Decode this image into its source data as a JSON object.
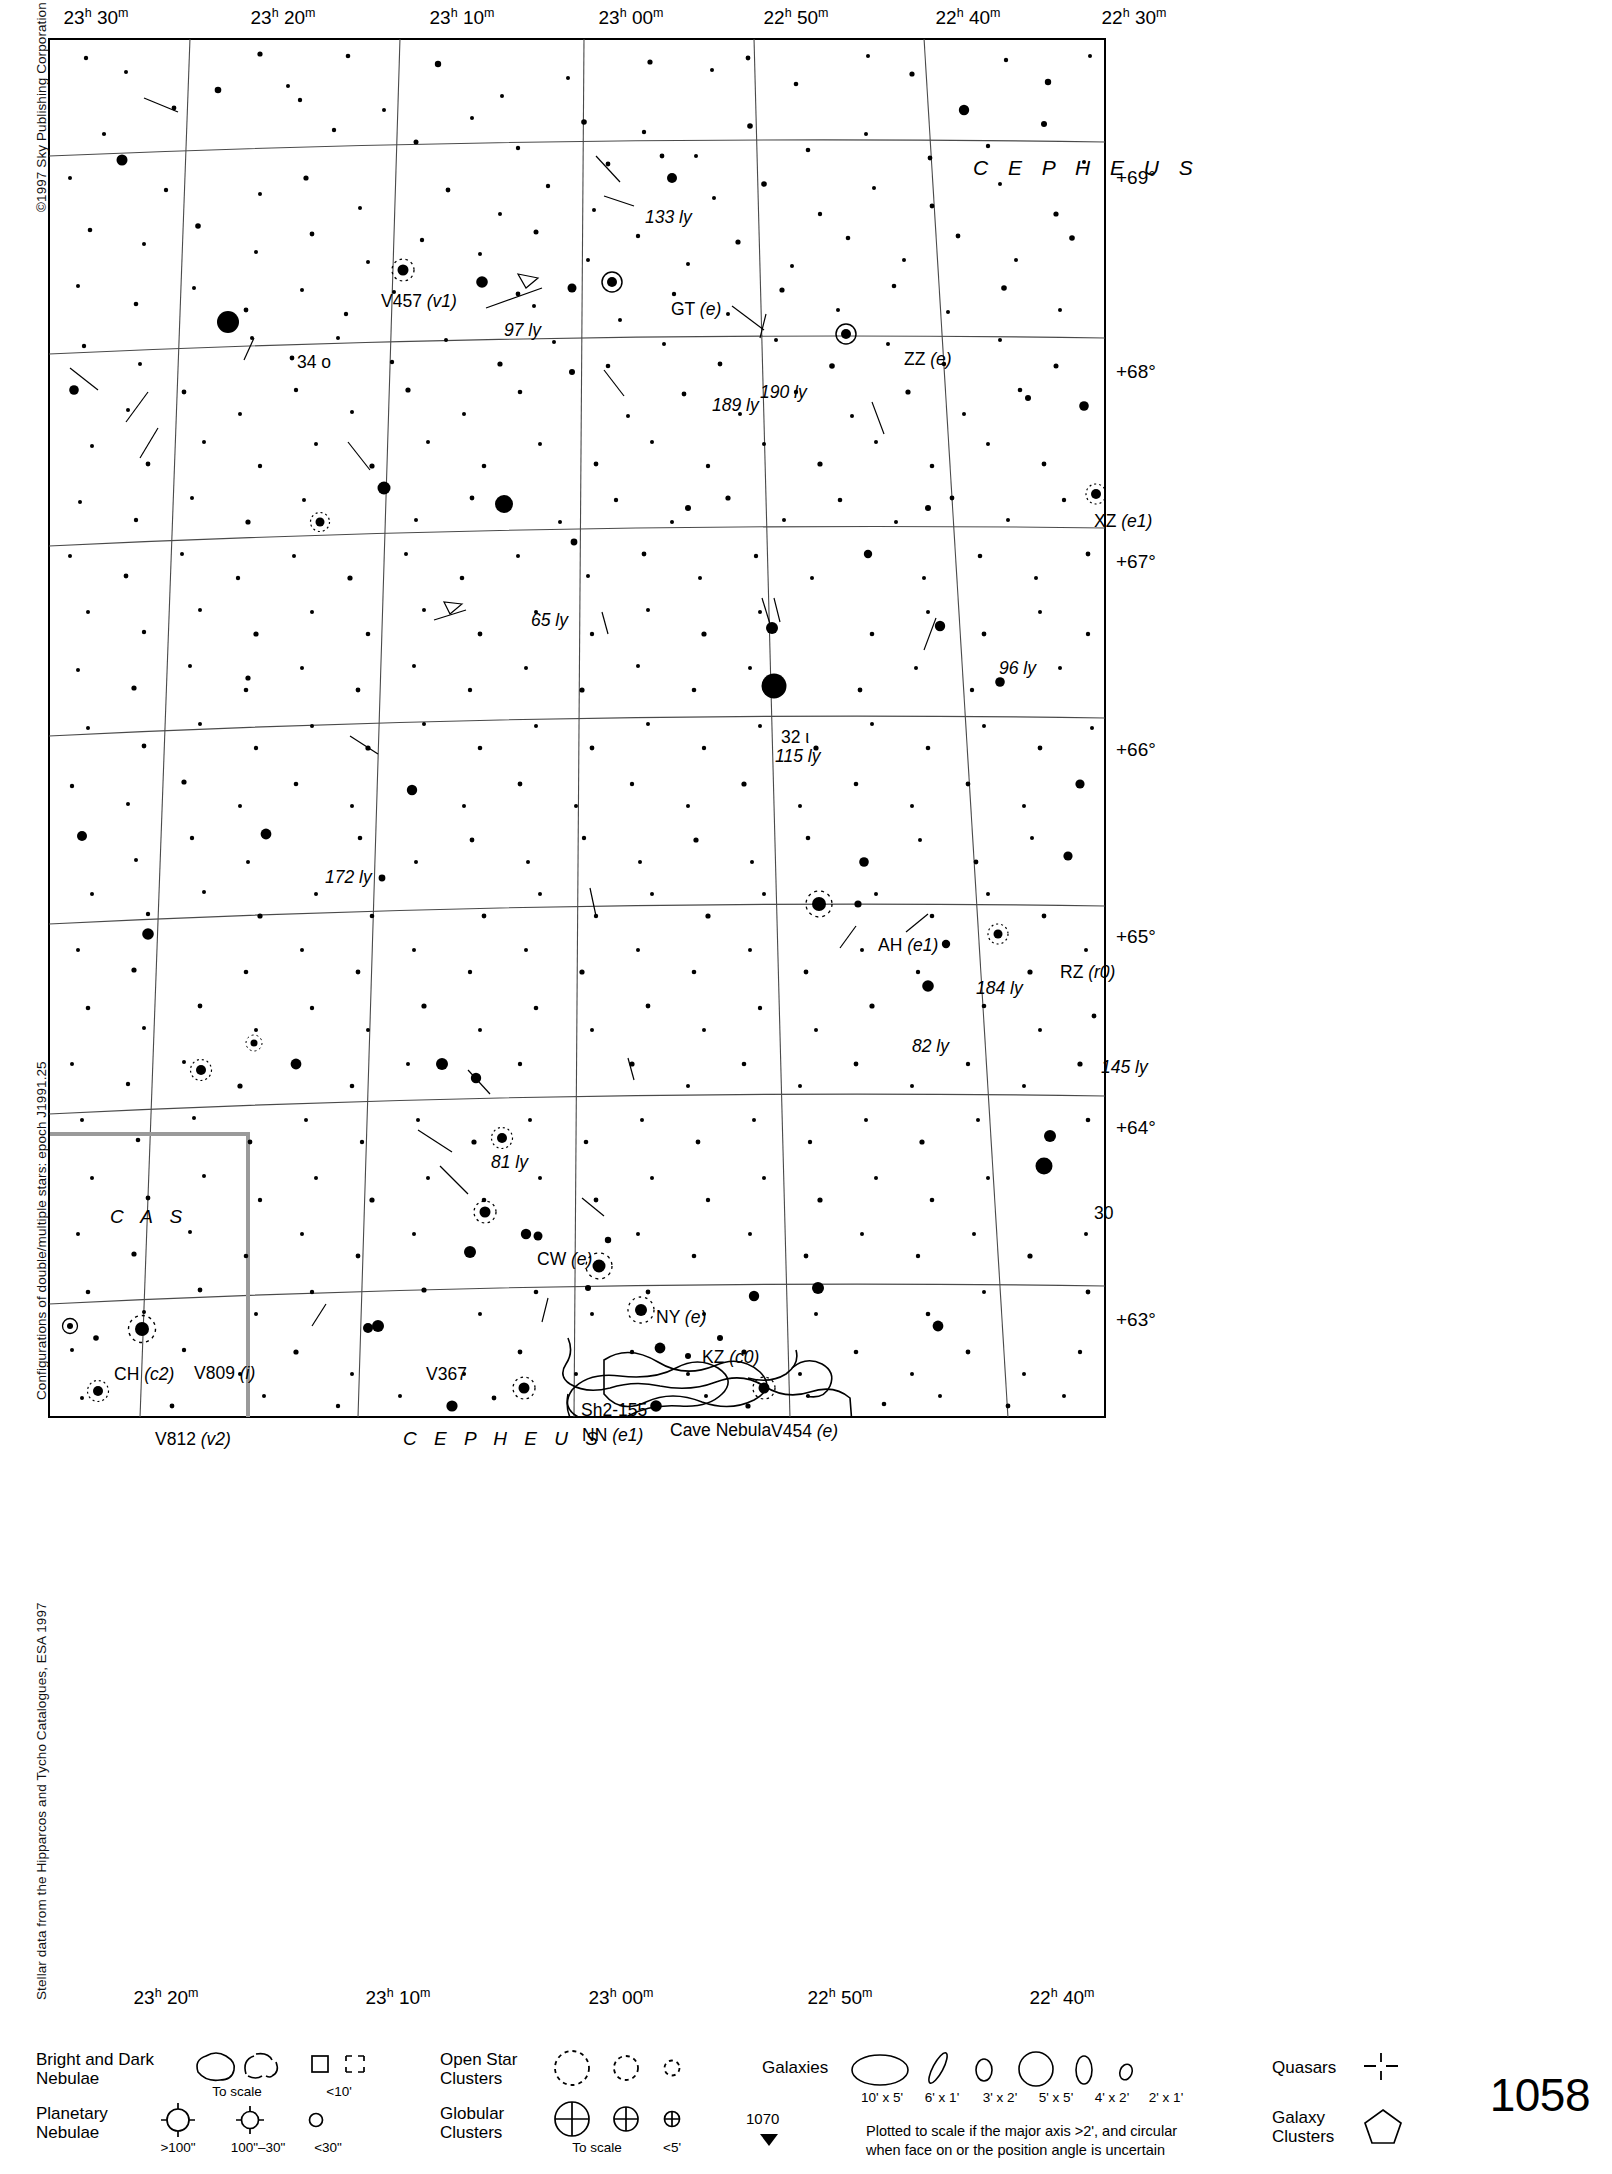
{
  "meta": {
    "page_number": "1058",
    "next_page_number": "1070",
    "credit_left": "©1997 Sky Publishing Corporation",
    "credit_mid": "Configurations of double/multiple stars: epoch J1991.25",
    "credit_bottom": "Stellar data from the Hipparcos and Tycho Catalogues, ESA 1997"
  },
  "axes": {
    "ra_top": [
      {
        "h": "23",
        "m": "30",
        "x": 48
      },
      {
        "h": "23",
        "m": "20",
        "x": 235
      },
      {
        "h": "23",
        "m": "10",
        "x": 414
      },
      {
        "h": "23",
        "m": "00",
        "x": 583
      },
      {
        "h": "22",
        "m": "50",
        "x": 748
      },
      {
        "h": "22",
        "m": "40",
        "x": 920
      },
      {
        "h": "22",
        "m": "30",
        "x": 1086
      }
    ],
    "ra_bottom": [
      {
        "h": "23",
        "m": "20",
        "x": 118
      },
      {
        "h": "23",
        "m": "10",
        "x": 350
      },
      {
        "h": "23",
        "m": "00",
        "x": 573
      },
      {
        "h": "22",
        "m": "50",
        "x": 792
      },
      {
        "h": "22",
        "m": "40",
        "x": 1014
      }
    ],
    "dec_right": [
      {
        "label": "+69°",
        "y": 140
      },
      {
        "label": "+68°",
        "y": 334
      },
      {
        "label": "+67°",
        "y": 524
      },
      {
        "label": "+66°",
        "y": 712
      },
      {
        "label": "+65°",
        "y": 899
      },
      {
        "label": "+64°",
        "y": 1090
      },
      {
        "label": "+63°",
        "y": 1282
      }
    ]
  },
  "constellations": [
    {
      "name": "C E P H E U S",
      "x": 925,
      "y": 118
    },
    {
      "name": "C A S",
      "x": 62,
      "y": 1168
    },
    {
      "name": "C E P H E U S",
      "x": 355,
      "y": 1390
    }
  ],
  "star_labels": [
    {
      "text": "133 ly",
      "x": 597,
      "y": 170,
      "italic": true
    },
    {
      "text": "V457",
      "suffix": "(v1)",
      "x": 333,
      "y": 254
    },
    {
      "text": "97 ly",
      "x": 456,
      "y": 283,
      "italic": true
    },
    {
      "text": "GT",
      "suffix": "(e)",
      "x": 623,
      "y": 262
    },
    {
      "text": "ZZ",
      "suffix": "(e)",
      "x": 856,
      "y": 312
    },
    {
      "text": "34 o",
      "x": 249,
      "y": 315
    },
    {
      "text": "190 ly",
      "x": 712,
      "y": 345,
      "italic": true
    },
    {
      "text": "189 ly",
      "x": 664,
      "y": 358,
      "italic": true
    },
    {
      "text": "XZ",
      "suffix": "(e1)",
      "x": 1046,
      "y": 474
    },
    {
      "text": "65 ly",
      "x": 483,
      "y": 573,
      "italic": true
    },
    {
      "text": "96 ly",
      "x": 951,
      "y": 621,
      "italic": true
    },
    {
      "text": "32 ι",
      "x": 733,
      "y": 690
    },
    {
      "text": "115 ly",
      "x": 727,
      "y": 709,
      "italic": true
    },
    {
      "text": "172 ly",
      "x": 277,
      "y": 830,
      "italic": true
    },
    {
      "text": "AH",
      "suffix": "(e1)",
      "x": 830,
      "y": 898
    },
    {
      "text": "RZ",
      "suffix": "(r0)",
      "x": 1012,
      "y": 925
    },
    {
      "text": "184 ly",
      "x": 928,
      "y": 941,
      "italic": true
    },
    {
      "text": "82 ly",
      "x": 864,
      "y": 999,
      "italic": true
    },
    {
      "text": "145 ly",
      "x": 1053,
      "y": 1020,
      "italic": true
    },
    {
      "text": "81 ly",
      "x": 443,
      "y": 1115,
      "italic": true
    },
    {
      "text": "30",
      "x": 1046,
      "y": 1166
    },
    {
      "text": "CW",
      "suffix": "(e)",
      "x": 489,
      "y": 1212
    },
    {
      "text": "NY",
      "suffix": "(e)",
      "x": 608,
      "y": 1270
    },
    {
      "text": "KZ",
      "suffix": "(c0)",
      "x": 654,
      "y": 1310
    },
    {
      "text": "CH",
      "suffix": "(c2)",
      "x": 66,
      "y": 1327
    },
    {
      "text": "V809",
      "suffix": "(i)",
      "x": 146,
      "y": 1326
    },
    {
      "text": "V367",
      "x": 378,
      "y": 1327
    },
    {
      "text": "Sh2-155",
      "x": 533,
      "y": 1363
    },
    {
      "text": "Cave Nebula",
      "x": 622,
      "y": 1383
    },
    {
      "text": "V454",
      "suffix": "(e)",
      "x": 723,
      "y": 1384
    },
    {
      "text": "NN",
      "suffix": "(e1)",
      "x": 534,
      "y": 1388
    },
    {
      "text": "V812",
      "suffix": "(v2)",
      "x": 107,
      "y": 1392
    }
  ],
  "legend": {
    "nebulae": {
      "label_line1": "Bright and Dark",
      "label_line2": "Nebulae",
      "cap_to_scale": "To scale",
      "cap_small": "<10'"
    },
    "planetary": {
      "label_line1": "Planetary",
      "label_line2": "Nebulae",
      "cap_large": ">100\"",
      "cap_mid": "100\"–30\"",
      "cap_small": "<30\""
    },
    "open_clusters": {
      "label_line1": "Open Star",
      "label_line2": "Clusters"
    },
    "globular_clusters": {
      "label_line1": "Globular",
      "label_line2": "Clusters",
      "cap_to_scale": "To scale",
      "cap_small": "<5'"
    },
    "galaxies": {
      "label": "Galaxies",
      "sizes": [
        "10' x 5'",
        "6' x 1'",
        "3' x 2'",
        "5' x 5'",
        "4' x 2'",
        "2' x 1'"
      ],
      "note_line1": "Plotted to scale if the major axis >2', and circular",
      "note_line2": "when face on or the position angle is uncertain"
    },
    "quasars": {
      "label": "Quasars"
    },
    "galaxy_clusters": {
      "label_line1": "Galaxy",
      "label_line2": "Clusters"
    }
  },
  "chart_data": {
    "type": "scatter",
    "xlabel": "Right Ascension",
    "ylabel": "Declination",
    "xlim": [
      "22h 30m",
      "23h 30m"
    ],
    "ylim": [
      "+62.6°",
      "+69.5°"
    ],
    "grid": true,
    "ra_gridlines": [
      "23h 30m",
      "23h 20m",
      "23h 10m",
      "23h 00m",
      "22h 50m",
      "22h 40m",
      "22h 30m"
    ],
    "dec_gridlines": [
      "+69°",
      "+68°",
      "+67°",
      "+66°",
      "+65°",
      "+64°",
      "+63°"
    ],
    "named_objects": [
      {
        "name": "34 o Cep",
        "distance_ly": null,
        "type": "star"
      },
      {
        "name": "32 ι Cep",
        "distance_ly": 115,
        "type": "star"
      },
      {
        "name": "30 Cep",
        "distance_ly": null,
        "type": "star"
      },
      {
        "name": "V457 Cep",
        "config": "v1",
        "type": "variable"
      },
      {
        "name": "GT Cep",
        "config": "e",
        "type": "variable"
      },
      {
        "name": "ZZ Cep",
        "config": "e",
        "type": "variable"
      },
      {
        "name": "XZ Cep",
        "config": "e1",
        "type": "variable"
      },
      {
        "name": "AH Cep",
        "config": "e1",
        "type": "variable"
      },
      {
        "name": "RZ Cep",
        "config": "r0",
        "type": "variable"
      },
      {
        "name": "CW Cep",
        "config": "e",
        "type": "variable"
      },
      {
        "name": "NY Cep",
        "config": "e",
        "type": "variable"
      },
      {
        "name": "KZ Cep",
        "config": "c0",
        "type": "variable"
      },
      {
        "name": "NN Cep",
        "config": "e1",
        "type": "variable"
      },
      {
        "name": "V454 Cep",
        "config": "e",
        "type": "variable"
      },
      {
        "name": "CH Cas",
        "config": "c2",
        "type": "variable"
      },
      {
        "name": "V809 Cas",
        "config": "i",
        "type": "variable"
      },
      {
        "name": "V812 Cas",
        "config": "v2",
        "type": "variable"
      },
      {
        "name": "V367 Cep",
        "type": "variable"
      },
      {
        "name": "Sh2-155",
        "type": "nebula"
      },
      {
        "name": "Cave Nebula",
        "type": "nebula"
      }
    ],
    "distance_annotations_ly": [
      133,
      97,
      190,
      189,
      65,
      96,
      115,
      172,
      184,
      82,
      145,
      81
    ]
  }
}
